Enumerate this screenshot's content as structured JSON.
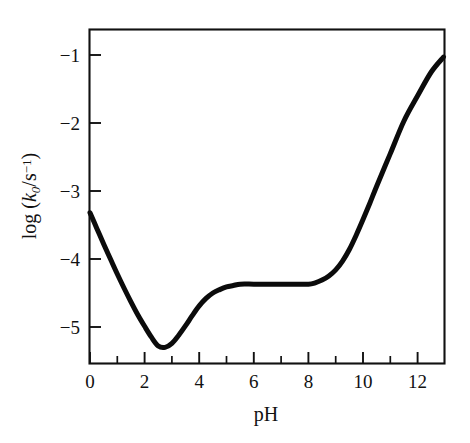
{
  "figure": {
    "background_color": "#ffffff",
    "curve_color": "#0b0b0b",
    "axis_color": "#111111"
  },
  "axes": {
    "x_title": "pH",
    "y_title_prefix": "log (",
    "y_title_symbol": "k",
    "y_title_subscript": "0",
    "y_title_middle": "/s",
    "y_title_superscript": "−1",
    "y_title_suffix": ")",
    "y_title_plain": "log (k0/s−1)",
    "x_tick_labels": [
      "0",
      "2",
      "4",
      "6",
      "8",
      "10",
      "12"
    ],
    "y_tick_labels": [
      "−1",
      "−2",
      "−3",
      "−4",
      "−5"
    ]
  },
  "chart_data": {
    "type": "line",
    "title": "",
    "subtitle": "",
    "xlabel": "pH",
    "ylabel": "log (k0/s^-1)",
    "xlim": [
      -0.05,
      12.95
    ],
    "ylim": [
      -5.62,
      -0.62
    ],
    "xticks": [
      0,
      2,
      4,
      6,
      8,
      10,
      12
    ],
    "xticks_minor": [
      1,
      3,
      5,
      7,
      9,
      11
    ],
    "yticks": [
      -1,
      -2,
      -3,
      -4,
      -5
    ],
    "grid": false,
    "legend": null,
    "annotations": [],
    "series": [
      {
        "name": "pH-rate profile",
        "color": "#0b0b0b",
        "x": [
          0.0,
          0.25,
          0.5,
          0.75,
          1.0,
          1.25,
          1.5,
          1.75,
          2.0,
          2.25,
          2.5,
          2.75,
          3.0,
          3.25,
          3.5,
          3.75,
          4.0,
          4.25,
          4.5,
          4.75,
          5.0,
          5.25,
          5.5,
          6.0,
          6.5,
          7.0,
          7.5,
          8.0,
          8.25,
          8.5,
          8.75,
          9.0,
          9.25,
          9.5,
          9.75,
          10.0,
          10.25,
          10.5,
          11.0,
          11.5,
          12.0,
          12.5,
          12.95
        ],
        "y": [
          -3.32,
          -3.55,
          -3.78,
          -4.0,
          -4.22,
          -4.43,
          -4.63,
          -4.82,
          -4.99,
          -5.15,
          -5.28,
          -5.3,
          -5.24,
          -5.12,
          -4.98,
          -4.83,
          -4.69,
          -4.58,
          -4.5,
          -4.45,
          -4.41,
          -4.39,
          -4.37,
          -4.37,
          -4.37,
          -4.37,
          -4.37,
          -4.37,
          -4.35,
          -4.31,
          -4.25,
          -4.16,
          -4.03,
          -3.86,
          -3.65,
          -3.42,
          -3.18,
          -2.93,
          -2.45,
          -1.97,
          -1.6,
          -1.25,
          -1.03
        ],
        "key_points": {
          "start": {
            "pH": 0.0,
            "log_k0": -3.32
          },
          "minimum": {
            "pH": 2.6,
            "log_k0": -5.3
          },
          "plateau": {
            "pH_range": [
              5.5,
              8.2
            ],
            "log_k0": -4.37
          },
          "end": {
            "pH": 12.95,
            "log_k0": -1.03
          }
        }
      }
    ]
  }
}
